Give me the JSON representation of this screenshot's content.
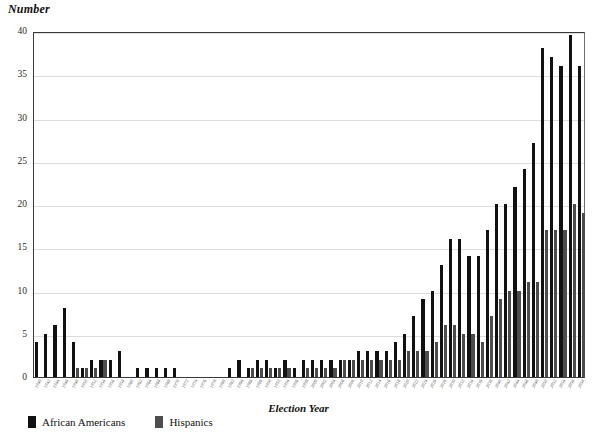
{
  "chart_data": {
    "type": "bar",
    "title": "",
    "xlabel": "Election Year",
    "ylabel": "Number",
    "ylim": [
      0,
      40
    ],
    "yticks": [
      0,
      5,
      10,
      15,
      20,
      25,
      30,
      35,
      40
    ],
    "grid": true,
    "legend_position": "bottom-left",
    "colors": {
      "african_americans": "#111111",
      "hispanics": "#4d4d4d"
    },
    "categories": [
      "1940",
      "1942",
      "1944",
      "1946",
      "1948",
      "1950",
      "1952",
      "1954",
      "1956",
      "1958",
      "1960",
      "1962",
      "1964",
      "1966",
      "1968",
      "1970",
      "1972",
      "1974",
      "1976",
      "1978",
      "1980",
      "1982",
      "1984",
      "1986",
      "1988",
      "1990",
      "1992",
      "1994",
      "1996",
      "1998",
      "2000",
      "2002",
      "2004",
      "2006",
      "2008",
      "2010",
      "2012",
      "2014",
      "2016",
      "2018",
      "2020",
      "2022",
      "2024",
      "2026",
      "2028",
      "2030",
      "2032",
      "2034",
      "2036",
      "2038",
      "2040",
      "2042",
      "2044",
      "2046",
      "2048",
      "2050",
      "2052",
      "2054"
    ],
    "series": [
      {
        "name": "African Americans",
        "color": "#111111",
        "values": [
          4,
          5,
          6,
          8,
          4,
          1,
          1,
          1,
          2,
          2,
          0,
          3,
          0,
          1,
          1,
          1,
          1,
          1,
          0,
          0,
          0,
          0,
          0,
          0,
          0,
          0,
          2,
          2,
          1,
          2,
          2,
          1,
          1,
          2,
          2,
          2,
          2,
          2,
          2,
          2,
          3,
          3,
          3,
          3,
          4,
          5,
          7,
          9,
          10,
          12,
          15,
          16,
          13,
          17,
          20,
          23,
          26,
          30
        ]
      },
      {
        "name": "Hispanics",
        "color": "#4d4d4d",
        "values": [
          0,
          0,
          0,
          0,
          0,
          0,
          0,
          0,
          0,
          0,
          0,
          0,
          0,
          0,
          0,
          0,
          0,
          0,
          0,
          0,
          0,
          0,
          0,
          0,
          0,
          0,
          0,
          0,
          0,
          0,
          0,
          0,
          0,
          0,
          0,
          0,
          0,
          0,
          0,
          0,
          0,
          0,
          0,
          0,
          0,
          0,
          0,
          0,
          0,
          0,
          0,
          0,
          0,
          0,
          0,
          0,
          0,
          0
        ]
      }
    ],
    "pairs": [
      {
        "year": "1940",
        "aa": 4,
        "hi": 0
      },
      {
        "year": "1942",
        "aa": 5,
        "hi": 0
      },
      {
        "year": "1944",
        "aa": 6,
        "hi": 0
      },
      {
        "year": "1946",
        "aa": 8,
        "hi": 0
      },
      {
        "year": "1948",
        "aa": 4,
        "hi": 1
      },
      {
        "year": "1950",
        "aa": 1,
        "hi": 1
      },
      {
        "year": "1952",
        "aa": 2,
        "hi": 1
      },
      {
        "year": "1954",
        "aa": 2,
        "hi": 2
      },
      {
        "year": "1956",
        "aa": 2,
        "hi": 0
      },
      {
        "year": "1958",
        "aa": 3,
        "hi": 0
      },
      {
        "year": "1960",
        "aa": 0,
        "hi": 0
      },
      {
        "year": "1962",
        "aa": 1,
        "hi": 0
      },
      {
        "year": "1964",
        "aa": 1,
        "hi": 0
      },
      {
        "year": "1966",
        "aa": 1,
        "hi": 0
      },
      {
        "year": "1968",
        "aa": 1,
        "hi": 0
      },
      {
        "year": "1970",
        "aa": 1,
        "hi": 0
      },
      {
        "year": "1972",
        "aa": 0,
        "hi": 0
      },
      {
        "year": "1974",
        "aa": 0,
        "hi": 0
      },
      {
        "year": "1976",
        "aa": 0,
        "hi": 0
      },
      {
        "year": "1978",
        "aa": 0,
        "hi": 0
      },
      {
        "year": "1980",
        "aa": 0,
        "hi": 0
      },
      {
        "year": "1982",
        "aa": 1,
        "hi": 0
      },
      {
        "year": "1984",
        "aa": 2,
        "hi": 0
      },
      {
        "year": "1986",
        "aa": 1,
        "hi": 1
      },
      {
        "year": "1988",
        "aa": 2,
        "hi": 1
      },
      {
        "year": "1990",
        "aa": 2,
        "hi": 1
      },
      {
        "year": "1992",
        "aa": 1,
        "hi": 1
      },
      {
        "year": "1994",
        "aa": 2,
        "hi": 1
      },
      {
        "year": "1996",
        "aa": 1,
        "hi": 0
      },
      {
        "year": "1998",
        "aa": 2,
        "hi": 1
      },
      {
        "year": "2000",
        "aa": 2,
        "hi": 1
      },
      {
        "year": "2002",
        "aa": 2,
        "hi": 1
      },
      {
        "year": "2004",
        "aa": 2,
        "hi": 1
      },
      {
        "year": "2006",
        "aa": 2,
        "hi": 2
      },
      {
        "year": "2008",
        "aa": 2,
        "hi": 2
      },
      {
        "year": "2010",
        "aa": 3,
        "hi": 2
      },
      {
        "year": "2012",
        "aa": 3,
        "hi": 2
      },
      {
        "year": "2014",
        "aa": 3,
        "hi": 2
      },
      {
        "year": "2016",
        "aa": 3,
        "hi": 2
      },
      {
        "year": "2018",
        "aa": 4,
        "hi": 2
      },
      {
        "year": "2020",
        "aa": 5,
        "hi": 3
      },
      {
        "year": "2022",
        "aa": 7,
        "hi": 3
      },
      {
        "year": "2024",
        "aa": 9,
        "hi": 3
      },
      {
        "year": "2026",
        "aa": 10,
        "hi": 4
      },
      {
        "year": "2028",
        "aa": 13,
        "hi": 6
      },
      {
        "year": "2030",
        "aa": 16,
        "hi": 6
      },
      {
        "year": "2032",
        "aa": 16,
        "hi": 5
      },
      {
        "year": "2034",
        "aa": 14,
        "hi": 5
      },
      {
        "year": "2036",
        "aa": 14,
        "hi": 4
      },
      {
        "year": "2038",
        "aa": 17,
        "hi": 7
      },
      {
        "year": "2040",
        "aa": 20,
        "hi": 9
      },
      {
        "year": "2042",
        "aa": 20,
        "hi": 10
      },
      {
        "year": "2044",
        "aa": 22,
        "hi": 10
      },
      {
        "year": "2046",
        "aa": 24,
        "hi": 11
      },
      {
        "year": "2048",
        "aa": 27,
        "hi": 11
      },
      {
        "year": "2050",
        "aa": 38,
        "hi": 17
      },
      {
        "year": "2052",
        "aa": 37,
        "hi": 17
      },
      {
        "year": "2054",
        "aa": 36,
        "hi": 17
      },
      {
        "year": "2056",
        "aa": 39.5,
        "hi": 20
      },
      {
        "year": "2058",
        "aa": 36,
        "hi": 19
      }
    ]
  },
  "legend": {
    "items": [
      {
        "label": "African Americans",
        "color": "#111111",
        "key": "aa"
      },
      {
        "label": "Hispanics",
        "color": "#4d4d4d",
        "key": "hi"
      }
    ]
  }
}
